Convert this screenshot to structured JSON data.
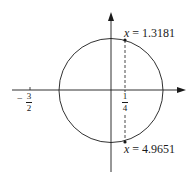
{
  "diagram": {
    "type": "circle-on-axes",
    "colors": {
      "stroke": "#1a1a1a",
      "background": "#ffffff"
    },
    "axes": {
      "x_axis": {
        "direction": "right",
        "has_arrow": true
      },
      "y_axis": {
        "direction": "up",
        "has_arrow": true
      }
    },
    "circle": {
      "center_label": "origin",
      "passes_through_x_axis_left": "-3/2"
    },
    "tick_labels": {
      "left": {
        "sign": "−",
        "numerator": "3",
        "denominator": "2"
      },
      "right": {
        "numerator": "1",
        "denominator": "4"
      }
    },
    "dashed_line": {
      "at": "1/4",
      "style": "dashed"
    },
    "points": [
      {
        "var": "x",
        "eq": " = ",
        "value": "1.3181",
        "position": "top"
      },
      {
        "var": "x",
        "eq": " = ",
        "value": "4.9651",
        "position": "bottom"
      }
    ]
  }
}
